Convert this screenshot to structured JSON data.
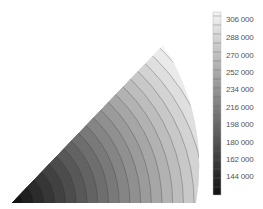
{
  "chart_data": {
    "type": "heatmap",
    "subtype": "filled contour on circular sector (wedge)",
    "title": "",
    "xlabel": "",
    "ylabel": "",
    "colormap": "grayscale (dark = low, light = high)",
    "colorbar": {
      "position": "right",
      "min": 126000,
      "max": 315000,
      "ticks": [
        306000,
        288000,
        270000,
        252000,
        234000,
        216000,
        198000,
        180000,
        162000,
        144000
      ],
      "tick_labels": [
        "306 000",
        "288 000",
        "270 000",
        "252 000",
        "234 000",
        "216 000",
        "198 000",
        "180 000",
        "162 000",
        "144 000"
      ],
      "contour_step": 9000
    },
    "domain_shape": "sector with apex angle ~45°, vertex at bottom-left, curved right edge",
    "trend": "value increases radially away from the bottom-left vertex, highest near the outer arc top",
    "grid": false,
    "legend": false
  },
  "colorbar_labels": [
    "306 000",
    "288 000",
    "270 000",
    "252 000",
    "234 000",
    "216 000",
    "198 000",
    "180 000",
    "162 000",
    "144 000"
  ]
}
